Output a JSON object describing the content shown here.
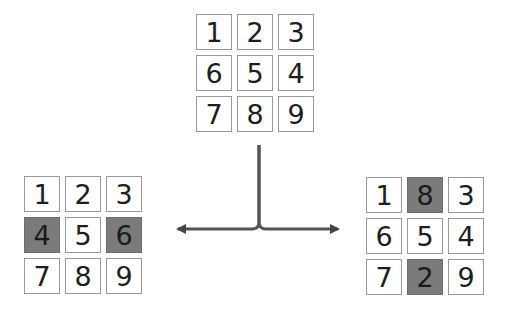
{
  "diagram": {
    "colors": {
      "cell_border": "#9a9a9a",
      "shaded_cell": "#7b7b7b",
      "arrow": "#444444",
      "text": "#1e1e1e"
    },
    "top_grid": {
      "cells": [
        {
          "label": "1",
          "shaded": false
        },
        {
          "label": "2",
          "shaded": false
        },
        {
          "label": "3",
          "shaded": false
        },
        {
          "label": "6",
          "shaded": false
        },
        {
          "label": "5",
          "shaded": false
        },
        {
          "label": "4",
          "shaded": false
        },
        {
          "label": "7",
          "shaded": false
        },
        {
          "label": "8",
          "shaded": false
        },
        {
          "label": "9",
          "shaded": false
        }
      ]
    },
    "left_grid": {
      "cells": [
        {
          "label": "1",
          "shaded": false
        },
        {
          "label": "2",
          "shaded": false
        },
        {
          "label": "3",
          "shaded": false
        },
        {
          "label": "4",
          "shaded": true
        },
        {
          "label": "5",
          "shaded": false
        },
        {
          "label": "6",
          "shaded": true
        },
        {
          "label": "7",
          "shaded": false
        },
        {
          "label": "8",
          "shaded": false
        },
        {
          "label": "9",
          "shaded": false
        }
      ]
    },
    "right_grid": {
      "cells": [
        {
          "label": "1",
          "shaded": false
        },
        {
          "label": "8",
          "shaded": true
        },
        {
          "label": "3",
          "shaded": false
        },
        {
          "label": "6",
          "shaded": false
        },
        {
          "label": "5",
          "shaded": false
        },
        {
          "label": "4",
          "shaded": false
        },
        {
          "label": "7",
          "shaded": false
        },
        {
          "label": "2",
          "shaded": true
        },
        {
          "label": "9",
          "shaded": false
        }
      ]
    }
  }
}
